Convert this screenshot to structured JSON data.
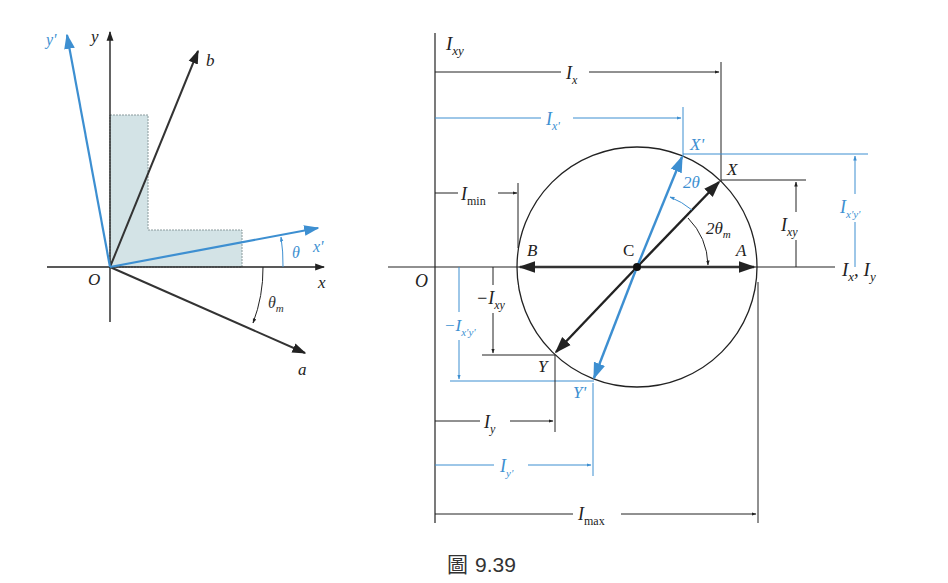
{
  "colors": {
    "ink": "#222222",
    "blue": "#3d8fd1",
    "fill": "#d3e3e6",
    "fill_edge": "#8a9a9c"
  },
  "left_diagram": {
    "origin_label": "O",
    "x_axis_label": "x",
    "y_axis_label": "y",
    "x_prime_label": "x'",
    "y_prime_label": "y'",
    "a_axis_label": "a",
    "b_axis_label": "b",
    "theta_label": "θ",
    "theta_m_label": "θ",
    "theta_m_sub": "m"
  },
  "mohr_circle": {
    "origin_label": "O",
    "vertical_axis_label": "I",
    "vertical_axis_sub": "xy",
    "horizontal_axis_label_1": "I",
    "horizontal_axis_sub_1": "x",
    "horizontal_axis_sep": ", ",
    "horizontal_axis_label_2": "I",
    "horizontal_axis_sub_2": "y",
    "center_label": "C",
    "point_a": "A",
    "point_b": "B",
    "point_x": "X",
    "point_y": "Y",
    "point_x_prime": "X'",
    "point_y_prime": "Y'",
    "angle_2theta": "2θ",
    "angle_2theta_m": "2θ",
    "angle_2theta_m_sub": "m",
    "dim_ix": {
      "main": "I",
      "sub": "x"
    },
    "dim_ix_prime": {
      "main": "I",
      "sub": "x'"
    },
    "dim_imin": {
      "main": "I",
      "sub": "min"
    },
    "dim_ixy": {
      "main": "I",
      "sub": "xy"
    },
    "dim_ixpyp": {
      "main": "I",
      "sub": "x'y'"
    },
    "dim_neg_ixy": {
      "main": "−I",
      "sub": "xy"
    },
    "dim_neg_ixpyp": {
      "main": "−I",
      "sub": "x'y'"
    },
    "dim_iy": {
      "main": "I",
      "sub": "y"
    },
    "dim_iy_prime": {
      "main": "I",
      "sub": "y'"
    },
    "dim_imax": {
      "main": "I",
      "sub": "max"
    }
  },
  "caption": {
    "prefix": "圖",
    "number": "9.39"
  }
}
